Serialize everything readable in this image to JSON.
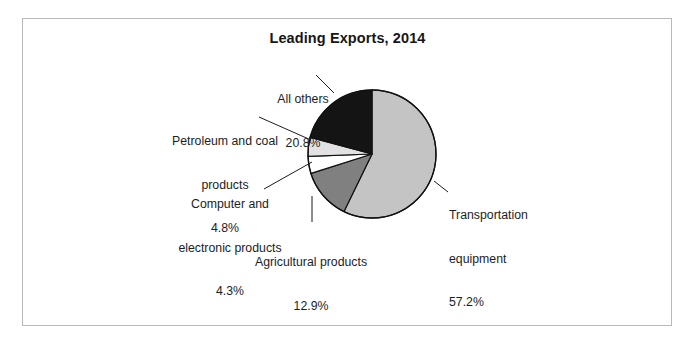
{
  "chart_data": {
    "type": "pie",
    "title": "Leading Exports, 2014",
    "xlabel": "",
    "ylabel": "",
    "legend": "none",
    "grid": false,
    "units": "percent",
    "start_angle_deg": 0,
    "direction": "clockwise",
    "categories": [
      "Transportation equipment",
      "Agricultural products",
      "Computer and electronic products",
      "Petroleum and coal products",
      "All others"
    ],
    "values": [
      57.2,
      12.9,
      4.3,
      4.8,
      20.8
    ],
    "slices": [
      {
        "name": "Transportation equipment",
        "value": 57.2,
        "value_label": "57.2%",
        "color": "#c4c4c4",
        "label_lines": [
          "Transportation",
          "equipment",
          "57.2%"
        ]
      },
      {
        "name": "Agricultural products",
        "value": 12.9,
        "value_label": "12.9%",
        "color": "#808080",
        "label_lines": [
          "Agricultural products",
          "12.9%"
        ]
      },
      {
        "name": "Computer and electronic products",
        "value": 4.3,
        "value_label": "4.3%",
        "color": "#ffffff",
        "label_lines": [
          "Computer and",
          "electronic products",
          "4.3%"
        ]
      },
      {
        "name": "Petroleum and coal products",
        "value": 4.8,
        "value_label": "4.8%",
        "color": "#e2e2e2",
        "label_lines": [
          "Petroleum and coal",
          "products",
          "4.8%"
        ]
      },
      {
        "name": "All others",
        "value": 20.8,
        "value_label": "20.8%",
        "color": "#141414",
        "label_lines": [
          "All others",
          "20.8%"
        ]
      }
    ]
  },
  "labels": {
    "all_others": {
      "line1": "All others",
      "line2": "20.8%"
    },
    "petroleum": {
      "line1": "Petroleum and coal",
      "line2": "products",
      "line3": "4.8%"
    },
    "computer": {
      "line1": "Computer and",
      "line2": "electronic products",
      "line3": "4.3%"
    },
    "agricultural": {
      "line1": "Agricultural products",
      "line2": "12.9%"
    },
    "transportation": {
      "line1": "Transportation",
      "line2": "equipment",
      "line3": "57.2%"
    }
  },
  "colors": {
    "slice_transportation": "#c4c4c4",
    "slice_agricultural": "#808080",
    "slice_computer": "#ffffff",
    "slice_petroleum": "#e2e2e2",
    "slice_all_others": "#141414",
    "outline": "#111111",
    "frame_border": "#b9b9b9",
    "text": "#1d1d1d",
    "background": "#ffffff"
  }
}
